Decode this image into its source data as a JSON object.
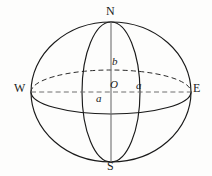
{
  "figure": {
    "type": "geometry-diagram",
    "width": 212,
    "height": 176,
    "background_color": "#fdfdfc",
    "stroke_color": "#1a1a1a",
    "axis_color": "#6f6f6f"
  },
  "labels": {
    "north": "N",
    "south": "S",
    "west": "W",
    "east": "E",
    "origin": "O",
    "semi_major_right": "a",
    "semi_major_below": "a",
    "semi_minor": "b"
  },
  "geometry": {
    "center": {
      "x": 111,
      "y": 92
    },
    "outline_ellipse": {
      "rx": 80,
      "ry": 70,
      "style": "solid"
    },
    "equator_ellipse": {
      "rx": 80,
      "ry": 22,
      "back_half": "dashed",
      "front_half": "solid"
    },
    "meridian_ellipse": {
      "rx": 29,
      "ry": 70,
      "style": "solid"
    },
    "polar_axis": {
      "x1": 111,
      "y1": 22,
      "x2": 111,
      "y2": 162,
      "style": "solid"
    },
    "equatorial_axis": {
      "x1": 31,
      "y1": 92,
      "x2": 191,
      "y2": 92,
      "style": "dashed"
    }
  }
}
